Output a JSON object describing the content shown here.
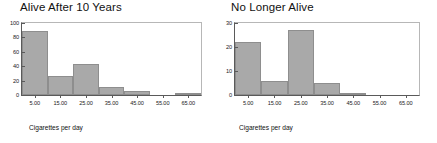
{
  "figure": {
    "panels": [
      {
        "title": "Alive After 10 Years",
        "xlabel": "Cigarettes per day",
        "yticks": [
          "0",
          "20",
          "40",
          "60",
          "80",
          "100"
        ],
        "ytick_values": [
          0,
          20,
          40,
          60,
          80,
          100
        ],
        "xticks": [
          "5.00",
          "15.00",
          "25.00",
          "35.00",
          "45.00",
          "55.00",
          "65.00"
        ],
        "xtick_values": [
          5,
          15,
          25,
          35,
          45,
          55,
          65
        ],
        "bars": [
          {
            "center": 5,
            "value": 89
          },
          {
            "center": 15,
            "value": 27
          },
          {
            "center": 25,
            "value": 43
          },
          {
            "center": 35,
            "value": 11
          },
          {
            "center": 45,
            "value": 5
          },
          {
            "center": 55,
            "value": 0
          },
          {
            "center": 65,
            "value": 1
          }
        ]
      },
      {
        "title": "No Longer Alive",
        "xlabel": "Cigarettes per day",
        "yticks": [
          "0",
          "10",
          "20",
          "30"
        ],
        "ytick_values": [
          0,
          10,
          20,
          30
        ],
        "xticks": [
          "5.00",
          "15.00",
          "25.00",
          "35.00",
          "45.00",
          "55.00",
          "65.00"
        ],
        "xtick_values": [
          5,
          15,
          25,
          35,
          45,
          55,
          65
        ],
        "bars": [
          {
            "center": 5,
            "value": 22
          },
          {
            "center": 15,
            "value": 6
          },
          {
            "center": 25,
            "value": 27
          },
          {
            "center": 35,
            "value": 5
          },
          {
            "center": 45,
            "value": 1
          },
          {
            "center": 55,
            "value": 0
          },
          {
            "center": 65,
            "value": 0
          }
        ]
      }
    ]
  },
  "chart_data": [
    {
      "type": "bar",
      "title": "Alive After 10 Years",
      "xlabel": "Cigarettes per day",
      "ylabel": "",
      "categories": [
        "5.00",
        "15.00",
        "25.00",
        "35.00",
        "45.00",
        "55.00",
        "65.00"
      ],
      "values": [
        89,
        27,
        43,
        11,
        5,
        0,
        1
      ],
      "xlim": [
        0,
        70
      ],
      "ylim": [
        0,
        100
      ],
      "ytick_step": 20,
      "grid": false,
      "legend": false,
      "bar_color": "#a9a9a9",
      "bar_edge_color": "#8e8e8e",
      "bin_width": 10
    },
    {
      "type": "bar",
      "title": "No Longer Alive",
      "xlabel": "Cigarettes per day",
      "ylabel": "",
      "categories": [
        "5.00",
        "15.00",
        "25.00",
        "35.00",
        "45.00",
        "55.00",
        "65.00"
      ],
      "values": [
        22,
        6,
        27,
        5,
        1,
        0,
        0
      ],
      "xlim": [
        0,
        70
      ],
      "ylim": [
        0,
        30
      ],
      "ytick_step": 10,
      "grid": false,
      "legend": false,
      "bar_color": "#a9a9a9",
      "bar_edge_color": "#8e8e8e",
      "bin_width": 10
    }
  ],
  "colors": {
    "bar_fill": "#a9a9a9",
    "bar_edge": "#8e8e8e",
    "axis": "#5a5a5a",
    "frame_light": "#b7b7b7",
    "text": "#111111",
    "background": "#ffffff"
  }
}
